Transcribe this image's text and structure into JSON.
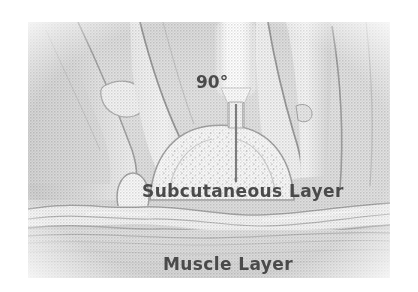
{
  "figure": {
    "name": "subcutaneous-injection-90-degree-illustration",
    "medium": "grayscale halftone medical illustration",
    "canvas": {
      "width": 418,
      "height": 292
    },
    "image_area": {
      "x": 28,
      "y": 22,
      "width": 362,
      "height": 256
    },
    "background_color": "#ffffff",
    "plate_base_color": "#d9d9d9",
    "ink_color": "#4a4a4a",
    "line_color": "#6f6f6f",
    "highlight_color": "#fbfbfb"
  },
  "labels": {
    "angle": {
      "text": "90°",
      "x": 196,
      "y": 88,
      "font_size": 17,
      "color": "#4f4f4f"
    },
    "subcutaneous": {
      "text": "Subcutaneous Layer",
      "x": 142,
      "y": 197,
      "font_size": 17,
      "color": "#4a4a4a"
    },
    "muscle": {
      "text": "Muscle Layer",
      "x": 163,
      "y": 270,
      "font_size": 17,
      "color": "#4a4a4a"
    }
  },
  "anatomy": {
    "layers": [
      {
        "name": "skin-fold",
        "description": "pinched raised skin bulge at center"
      },
      {
        "name": "subcutaneous-layer",
        "description": "stippled fatty tissue beneath skin"
      },
      {
        "name": "fascia-band",
        "description": "wavy connective tissue band"
      },
      {
        "name": "muscle-layer",
        "description": "striated muscle tissue at bottom"
      }
    ]
  },
  "instrument": {
    "name": "syringe",
    "parts": [
      {
        "name": "syringe-barrel",
        "description": "bright white vertical barrel"
      },
      {
        "name": "syringe-hub",
        "description": "narrow neck connecting barrel to needle"
      },
      {
        "name": "needle-shaft",
        "description": "thin dark vertical needle entering skin"
      }
    ],
    "insertion_angle_degrees": 90
  },
  "hands": {
    "left": {
      "name": "left-pinching-fingers",
      "description": "fingers pinching skin from left"
    },
    "right": {
      "name": "right-pinching-fingers",
      "description": "fingers pinching skin from right"
    }
  }
}
